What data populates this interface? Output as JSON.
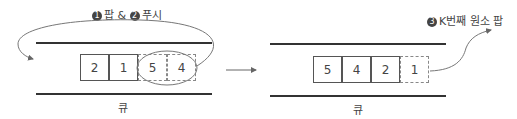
{
  "left": {
    "caption": {
      "step1_num": "1",
      "step1_text": "팝 &",
      "step2_num": "2",
      "step2_text": "푸시"
    },
    "queue_label": "큐",
    "cells": [
      {
        "value": "2",
        "style": "solid"
      },
      {
        "value": "1",
        "style": "solid"
      },
      {
        "value": "5",
        "style": "dashed"
      },
      {
        "value": "4",
        "style": "dashed"
      }
    ]
  },
  "right": {
    "caption": {
      "step3_num": "3",
      "step3_text": "K번째 원소 팝"
    },
    "queue_label": "큐",
    "cells": [
      {
        "value": "5",
        "style": "solid"
      },
      {
        "value": "4",
        "style": "solid"
      },
      {
        "value": "2",
        "style": "solid"
      },
      {
        "value": "1",
        "style": "dashed"
      }
    ]
  },
  "colors": {
    "rail": "#333333",
    "border": "#555555",
    "dashed": "#888888",
    "arrow": "#777777"
  }
}
